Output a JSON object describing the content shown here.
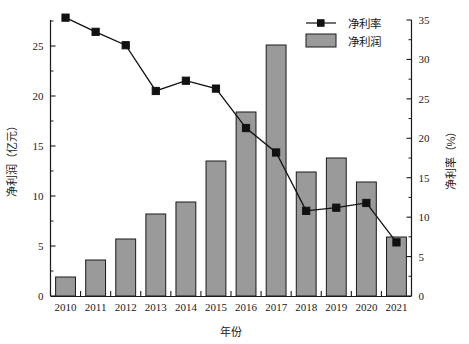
{
  "chart_data": {
    "type": "bar",
    "title": "",
    "xlabel": "年份",
    "ylabel": "净利润（亿元）",
    "y2label": "净利率（%）",
    "categories": [
      "2010",
      "2011",
      "2012",
      "2013",
      "2014",
      "2015",
      "2016",
      "2017",
      "2018",
      "2019",
      "2020",
      "2021"
    ],
    "grid": false,
    "legend_position": "top-right",
    "ylim": [
      0,
      27.6
    ],
    "y2lim": [
      0,
      35
    ],
    "yticks": [
      0,
      5,
      10,
      15,
      20,
      25
    ],
    "ytick_labels": [
      "0",
      "5",
      "10",
      "15",
      "20",
      "25"
    ],
    "y2ticks": [
      0,
      5,
      10,
      15,
      20,
      25,
      30,
      35
    ],
    "y2tick_labels": [
      "0",
      "5",
      "10",
      "15",
      "20",
      "25",
      "30",
      "35"
    ],
    "series": [
      {
        "name": "净利润",
        "type": "bar",
        "axis": "left",
        "unit": "亿元",
        "color": "#9a9a9a",
        "edge_color": "#1a1a1a",
        "values": [
          1.9,
          3.6,
          5.7,
          8.2,
          9.4,
          13.5,
          18.4,
          25.1,
          12.4,
          13.8,
          11.4,
          5.9
        ]
      },
      {
        "name": "净利率",
        "type": "line",
        "axis": "right",
        "unit": "%",
        "color": "#111111",
        "marker": "square",
        "values": [
          35.3,
          33.5,
          31.8,
          26.0,
          27.3,
          26.3,
          21.3,
          18.2,
          10.8,
          11.2,
          11.8,
          6.8
        ]
      }
    ]
  },
  "legend": {
    "items": [
      {
        "label": "净利率",
        "marker": "line-square"
      },
      {
        "label": "净利润",
        "marker": "filled-rect"
      }
    ]
  },
  "colors": {
    "bar_fill": "#9a9a9a",
    "bar_edge": "#1a1a1a",
    "line": "#111111",
    "axis": "#1a1a1a",
    "background": "#ffffff"
  }
}
